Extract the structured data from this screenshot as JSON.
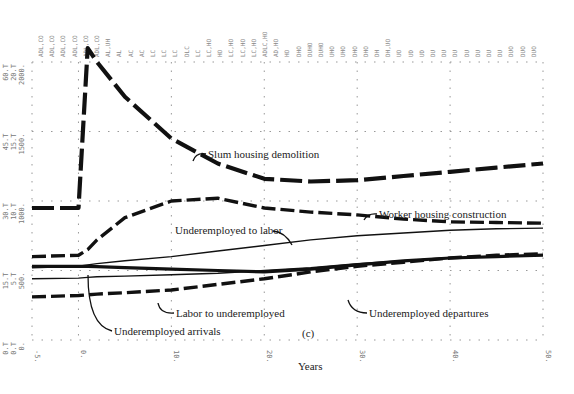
{
  "chart_data": {
    "type": "line",
    "title": "",
    "panel_label": "(c)",
    "xlabel": "Years",
    "ylabel": "",
    "xlim": [
      -5,
      50
    ],
    "ylim": [
      0,
      2000
    ],
    "x_ticks": [
      "-5.",
      "0.",
      "10.",
      "20.",
      "30.",
      "40.",
      "50."
    ],
    "y_ticks": [
      "0.",
      "500.",
      "1000.",
      "1500.",
      "2000."
    ],
    "y_tick_scales": [
      {
        "value": "2000.",
        "alt": [
          "20.T",
          "60.T"
        ]
      },
      {
        "value": "1500.",
        "alt": [
          "15.T",
          "45.T"
        ]
      },
      {
        "value": "1000.",
        "alt": [
          "10.T",
          "30.T"
        ]
      },
      {
        "value": "500.",
        "alt": [
          "5.T",
          "15.T"
        ]
      },
      {
        "value": "0.",
        "alt": [
          "0.T",
          "0.T"
        ]
      }
    ],
    "grid": "dotted",
    "x": [
      -5,
      0,
      1,
      2,
      5,
      10,
      15,
      20,
      25,
      30,
      35,
      40,
      45,
      50
    ],
    "series": [
      {
        "name": "Slum housing demolition",
        "style": "dash-heavy",
        "values": [
          950,
          950,
          2100,
          2000,
          1750,
          1450,
          1270,
          1160,
          1140,
          1150,
          1180,
          1210,
          1240,
          1270
        ]
      },
      {
        "name": "Worker housing construction",
        "style": "dash",
        "values": [
          600,
          610,
          650,
          720,
          880,
          1000,
          1020,
          950,
          920,
          900,
          870,
          850,
          845,
          840
        ]
      },
      {
        "name": "Underemployed to labor",
        "style": "solid-thin",
        "values": [
          520,
          530,
          540,
          550,
          570,
          600,
          640,
          680,
          720,
          750,
          770,
          790,
          800,
          805
        ]
      },
      {
        "name": "Labor to underemployed",
        "style": "dash",
        "values": [
          310,
          320,
          325,
          330,
          340,
          360,
          400,
          440,
          490,
          530,
          560,
          590,
          610,
          620
        ]
      },
      {
        "name": "Underemployed arrivals",
        "style": "solid-heavy",
        "values": [
          530,
          530,
          530,
          528,
          520,
          510,
          500,
          490,
          510,
          540,
          570,
          590,
          600,
          610
        ]
      },
      {
        "name": "Underemployed departures",
        "style": "solid-thin",
        "values": [
          440,
          445,
          450,
          455,
          460,
          470,
          480,
          500,
          520,
          550,
          570,
          590,
          600,
          610
        ]
      }
    ],
    "annotations": [
      "Slum housing demolition",
      "Worker housing construction",
      "Underemployed to labor",
      "Labor to underemployed",
      "Underemployed arrivals",
      "Underemployed departures",
      "(c)"
    ],
    "plot_codes_top": [
      "ADL,CO",
      "ADL,CO",
      "ADL,CO",
      "ADL,CO",
      "ADL,CO",
      "ADL,CO",
      "AL,UH",
      "AL",
      "AC",
      "AC",
      "LC",
      "LC",
      "LC",
      "DLC",
      "LC",
      "LC,HO",
      "HO",
      "LC,HO",
      "LC,HO",
      "LC,HO",
      "ADLC,HO",
      "AD,HO",
      "HO",
      "DHO",
      "DUHO",
      "DUHO",
      "UHO",
      "UHO",
      "DHO",
      "DHO",
      "DH",
      "DH,UO",
      "UO",
      "UD",
      "UD",
      "DU",
      "DU",
      "DU",
      "DU",
      "DU",
      "DU",
      "DU",
      "DUO",
      "DUO",
      "DUO"
    ]
  }
}
